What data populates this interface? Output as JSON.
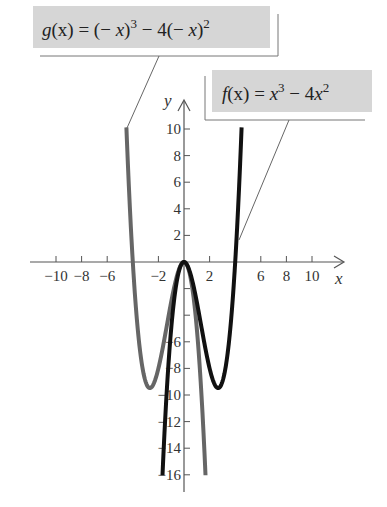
{
  "chart_data": {
    "type": "line",
    "title": "",
    "xlabel": "x",
    "ylabel": "y",
    "xlim": [
      -11,
      12
    ],
    "ylim": [
      -17,
      12
    ],
    "grid": false,
    "x_ticks": [
      -10,
      -8,
      -6,
      -4,
      -2,
      2,
      4,
      6,
      8,
      10
    ],
    "x_tick_labels": [
      "−10",
      "−8",
      "−6",
      "",
      "−2",
      "2",
      "",
      "6",
      "8",
      "10"
    ],
    "y_ticks": [
      10,
      8,
      6,
      4,
      2,
      -2,
      -4,
      -6,
      -8,
      -10,
      -12,
      -14,
      -16
    ],
    "y_tick_labels": [
      "10",
      "8",
      "6",
      "4",
      "2",
      "",
      "",
      "−6",
      "−8",
      "−10",
      "−12",
      "−14",
      "−16"
    ],
    "series": [
      {
        "name": "f(x) = x^3 − 4x^2",
        "expression": "x^3 - 4x^2",
        "color": "#111111",
        "domain": [
          -1.68,
          4.5
        ],
        "key_points": [
          {
            "x": -1.68,
            "y": -16
          },
          {
            "x": 0,
            "y": 0
          },
          {
            "x": 2.67,
            "y": -9.48
          },
          {
            "x": 4,
            "y": 0
          },
          {
            "x": 4.5,
            "y": 10.1
          }
        ]
      },
      {
        "name": "g(x) = (−x)^3 − 4(−x)^2",
        "expression": "-x^3 - 4x^2",
        "color": "#666666",
        "domain": [
          -4.5,
          1.68
        ],
        "key_points": [
          {
            "x": -4.5,
            "y": 10.1
          },
          {
            "x": -4,
            "y": 0
          },
          {
            "x": -2.67,
            "y": -9.48
          },
          {
            "x": 0,
            "y": 0
          },
          {
            "x": 1.68,
            "y": -16
          }
        ]
      }
    ],
    "annotations": [
      {
        "text": "g(x) = (− x)^3 − 4(− x)^2",
        "points_to": "g curve at (−4.5, 10)"
      },
      {
        "text": "f(x) = x^3 − 4x^2",
        "points_to": "f curve near (4.3, 2)"
      }
    ]
  },
  "labels": {
    "x_axis": "x",
    "y_axis": "y",
    "g_label": {
      "name": "g",
      "arg": "(x)",
      "eq": " = (− ",
      "x1": "x",
      "p1": ")",
      "e1": "3",
      "mid": " − 4(− ",
      "x2": "x",
      "p2": ")",
      "e2": "2"
    },
    "f_label": {
      "name": "f",
      "arg": "(x)",
      "eq": " = ",
      "x1": "x",
      "e1": "3",
      "mid": " − 4",
      "x2": "x",
      "e2": "2"
    }
  },
  "colors": {
    "label_box": "#d6d6d6",
    "axis": "#555555",
    "f_curve": "#111111",
    "g_curve": "#666666"
  }
}
